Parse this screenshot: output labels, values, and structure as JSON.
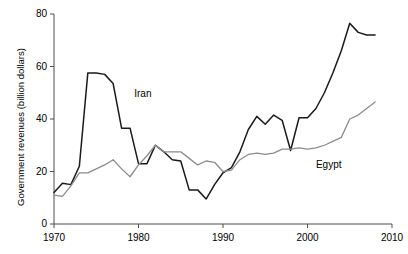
{
  "chart_data": {
    "type": "line",
    "title": "",
    "xlabel": "",
    "ylabel": "Government revenues (billion dollars)",
    "xlim": [
      1970,
      2010
    ],
    "ylim": [
      0,
      80
    ],
    "xticks": [
      1970,
      1980,
      1990,
      2000,
      2010
    ],
    "yticks": [
      0,
      20,
      40,
      60,
      80
    ],
    "xtick_labels": [
      "1970",
      "1980",
      "1990",
      "2000",
      "2010"
    ],
    "ytick_labels": [
      "0",
      "20",
      "40",
      "60",
      "80"
    ],
    "grid": false,
    "legend": "inline-annotations",
    "annotations": [
      {
        "text": "Iran",
        "x": 1979.5,
        "y": 49.5
      },
      {
        "text": "Egypt",
        "x": 2001.0,
        "y": 22.5
      }
    ],
    "x": [
      1970,
      1971,
      1972,
      1973,
      1974,
      1975,
      1976,
      1977,
      1978,
      1979,
      1980,
      1981,
      1982,
      1983,
      1984,
      1985,
      1986,
      1987,
      1988,
      1989,
      1990,
      1991,
      1992,
      1993,
      1994,
      1995,
      1996,
      1997,
      1998,
      1999,
      2000,
      2001,
      2002,
      2003,
      2004,
      2005,
      2006,
      2007,
      2008
    ],
    "series": [
      {
        "name": "Iran",
        "color": "#1a1a1a",
        "values": [
          12.0,
          15.5,
          15.0,
          22.0,
          57.5,
          57.5,
          57.0,
          53.5,
          36.5,
          36.5,
          23.0,
          23.0,
          30.0,
          27.5,
          24.5,
          24.0,
          13.0,
          13.0,
          9.5,
          15.0,
          19.5,
          21.5,
          27.5,
          36.0,
          41.0,
          38.0,
          41.5,
          39.5,
          28.0,
          40.5,
          40.5,
          44.0,
          50.0,
          57.5,
          66.0,
          76.5,
          73.0,
          72.0,
          72.0
        ]
      },
      {
        "name": "Egypt",
        "color": "#8c8c8c",
        "values": [
          11.0,
          10.5,
          14.5,
          19.5,
          19.5,
          21.0,
          22.5,
          24.5,
          21.0,
          18.0,
          22.5,
          26.0,
          30.0,
          27.5,
          27.5,
          27.5,
          25.0,
          22.5,
          24.0,
          23.5,
          20.0,
          20.5,
          24.5,
          26.5,
          27.0,
          26.5,
          27.0,
          28.5,
          28.5,
          29.0,
          28.5,
          29.0,
          30.0,
          31.5,
          33.0,
          40.0,
          41.5,
          44.0,
          46.5
        ]
      }
    ]
  },
  "axis": {
    "y_title": "Government revenues (billion dollars)"
  }
}
